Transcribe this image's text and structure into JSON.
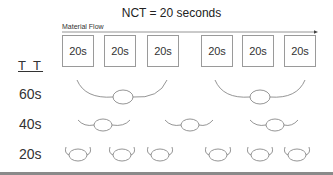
{
  "title": "NCT = 20 seconds",
  "flow": {
    "label": "Material Flow",
    "arrow_icon": "arrow-right-icon"
  },
  "header_label": "T T",
  "stations": [
    {
      "label": "20s",
      "x": 62
    },
    {
      "label": "20s",
      "x": 104
    },
    {
      "label": "20s",
      "x": 147
    },
    {
      "label": "20s",
      "x": 201
    },
    {
      "label": "20s",
      "x": 242
    },
    {
      "label": "20s",
      "x": 284
    }
  ],
  "rows": [
    {
      "label": "60s",
      "y": 88,
      "groups": [
        {
          "x1": 77,
          "x2": 167,
          "cx": 123,
          "cy": 97
        },
        {
          "x1": 215,
          "x2": 305,
          "cx": 260,
          "cy": 97
        }
      ]
    },
    {
      "label": "40s",
      "y": 118,
      "groups": [
        {
          "x1": 78,
          "x2": 130,
          "cx": 103,
          "cy": 125
        },
        {
          "x1": 165,
          "x2": 213,
          "cx": 190,
          "cy": 125
        },
        {
          "x1": 250,
          "x2": 298,
          "cx": 275,
          "cy": 125
        }
      ]
    },
    {
      "label": "20s",
      "y": 147,
      "groups": [
        {
          "cx": 78,
          "cy": 155
        },
        {
          "cx": 122,
          "cy": 155
        },
        {
          "cx": 160,
          "cy": 155
        },
        {
          "cx": 218,
          "cy": 155
        },
        {
          "cx": 260,
          "cy": 155
        },
        {
          "cx": 297,
          "cy": 155
        }
      ]
    }
  ],
  "colors": {
    "line": "#7a7a7a",
    "box_border": "#9a9a9a",
    "text": "#333333",
    "rule": "#8a8a8a"
  }
}
